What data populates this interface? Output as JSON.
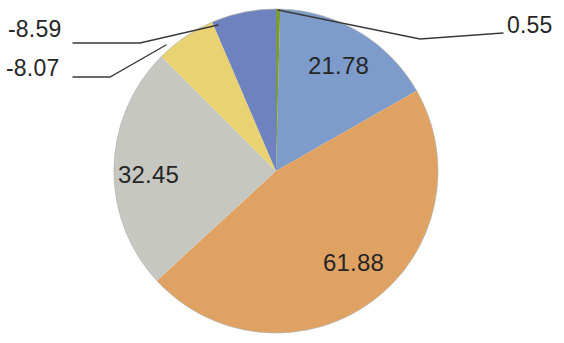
{
  "chart_data": {
    "type": "pie",
    "title": "",
    "subtitle": "",
    "xlabel": "",
    "ylabel": "",
    "legend": "none",
    "grid": false,
    "total": 133.32,
    "labels_shown_as": "value",
    "categories": [
      "Series 1",
      "Series 2",
      "Series 3",
      "Series 4",
      "Series 5",
      "Series 6"
    ],
    "values": [
      0.55,
      21.78,
      61.88,
      32.45,
      8.07,
      8.59
    ],
    "value_texts": [
      "0.55",
      "21.78",
      "61.88",
      "32.45",
      "-8.07",
      "-8.59"
    ],
    "colors": [
      "#7A9A3C",
      "#7D9CCB",
      "#E0A262",
      "#C7C7C2",
      "#E8D272",
      "#6F82C0"
    ],
    "slices": [
      {
        "name": "slice-green",
        "value": 0.55,
        "value_text": "0.55",
        "color": "#7A9A3C",
        "start_angle": 0.0,
        "sweep_angle": 1.49,
        "label_placement": "outside-right",
        "leader_line": true
      },
      {
        "name": "slice-blue",
        "value": 21.78,
        "value_text": "21.78",
        "color": "#7D9CCB",
        "start_angle": 1.49,
        "sweep_angle": 58.82,
        "label_placement": "inside",
        "leader_line": false
      },
      {
        "name": "slice-orange",
        "value": 61.88,
        "value_text": "61.88",
        "color": "#E0A262",
        "start_angle": 60.31,
        "sweep_angle": 167.11,
        "label_placement": "inside",
        "leader_line": false
      },
      {
        "name": "slice-gray",
        "value": 32.45,
        "value_text": "32.45",
        "color": "#C7C7C2",
        "start_angle": 227.42,
        "sweep_angle": 87.63,
        "label_placement": "inside",
        "leader_line": false
      },
      {
        "name": "slice-yellow",
        "value": 8.07,
        "value_text": "-8.07",
        "color": "#E8D272",
        "start_angle": 315.05,
        "sweep_angle": 21.79,
        "label_placement": "outside-left",
        "leader_line": true
      },
      {
        "name": "slice-indigo",
        "value": 8.59,
        "value_text": "-8.59",
        "color": "#6F82C0",
        "start_angle": 336.84,
        "sweep_angle": 23.19,
        "label_placement": "outside-left",
        "leader_line": true
      }
    ]
  }
}
